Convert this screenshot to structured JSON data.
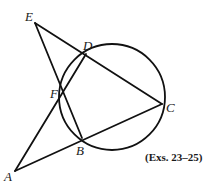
{
  "figure": {
    "caption": "(Exs. 23–25)",
    "points": {
      "A": {
        "label": "A",
        "x": 15,
        "y": 171,
        "lx": 4,
        "ly": 181
      },
      "B": {
        "label": "B",
        "x": 82,
        "y": 138,
        "lx": 76,
        "ly": 155
      },
      "C": {
        "label": "C",
        "x": 162,
        "y": 104,
        "lx": 166,
        "ly": 112
      },
      "D": {
        "label": "D",
        "x": 86,
        "y": 54,
        "lx": 83,
        "ly": 50
      },
      "E": {
        "label": "E",
        "x": 35,
        "y": 23,
        "lx": 25,
        "ly": 21
      },
      "F": {
        "label": "F",
        "x": 62,
        "y": 90,
        "lx": 50,
        "ly": 98
      }
    },
    "circle": {
      "cx": 112,
      "cy": 97,
      "r": 53,
      "through": [
        "D",
        "F",
        "B",
        "C"
      ]
    },
    "segments": [
      {
        "from": "E",
        "to": "C"
      },
      {
        "from": "A",
        "to": "C"
      },
      {
        "from": "A",
        "to": "D"
      },
      {
        "from": "E",
        "to": "B"
      }
    ],
    "stroke_color": "#111111"
  }
}
